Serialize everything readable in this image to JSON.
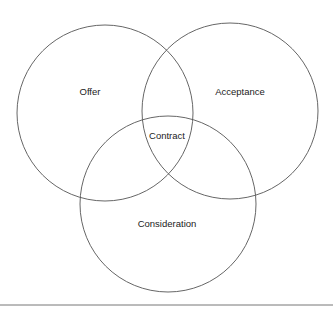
{
  "diagram": {
    "type": "venn",
    "circles": [
      {
        "id": "offer",
        "label": "Offer",
        "cx": 105,
        "cy": 113,
        "r": 88,
        "label_x": 90,
        "label_y": 92
      },
      {
        "id": "acceptance",
        "label": "Acceptance",
        "cx": 230,
        "cy": 111,
        "r": 88,
        "label_x": 240,
        "label_y": 92
      },
      {
        "id": "consideration",
        "label": "Consideration",
        "cx": 168,
        "cy": 204,
        "r": 88,
        "label_x": 167,
        "label_y": 226
      }
    ],
    "intersection": {
      "label": "Contract",
      "x": 167,
      "y": 139
    },
    "stroke_color": "#555555",
    "baseline": {
      "y": 305,
      "x1": 0,
      "x2": 333,
      "color": "#777777"
    }
  }
}
